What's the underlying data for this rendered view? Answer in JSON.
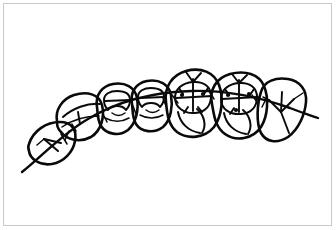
{
  "figure": {
    "title": "Occlusal view line drawing of a posterior dental arch segment",
    "caption": "",
    "view": "occlusal",
    "style": "hand-drawn black ink line art on white background",
    "background_color": "#ffffff",
    "ink_color": "#0a0a0a",
    "frame_color": "#c9c9c9",
    "width": 336,
    "height": 230
  },
  "chart_data": {
    "type": "diagram",
    "title": "Occlusal view line drawing of a posterior dental arch segment",
    "xlabel": "",
    "ylabel": "",
    "grid": false,
    "legend": false,
    "annotations": [],
    "arch_line": {
      "name": "arch-curve",
      "description": "Long continuous curved line (arch wire / occlusal plane reference) passing through all teeth",
      "start": [
        22,
        172
      ],
      "end": [
        318,
        118
      ],
      "apex": [
        200,
        103
      ]
    },
    "teeth": [
      {
        "index": 1,
        "name": "tooth-rotated-anterior",
        "label": "rotated premolar",
        "position": "far-left, tipped and rotated below the arch line",
        "center": [
          57,
          143
        ],
        "has_cusp_dots": false,
        "markings": "two internal converging ridge lines"
      },
      {
        "index": 2,
        "name": "tooth-premolar-1",
        "label": "premolar",
        "position": "left",
        "center": [
          80,
          113
        ],
        "has_cusp_dots": false,
        "markings": "single long mesiodistal ridge line"
      },
      {
        "index": 3,
        "name": "tooth-premolar-2",
        "label": "premolar",
        "position": "left-center",
        "center": [
          113,
          106
        ],
        "has_cusp_dots": false,
        "markings": "squared occlusal table outline with central groove"
      },
      {
        "index": 4,
        "name": "tooth-premolar-3",
        "label": "premolar",
        "position": "center-left",
        "center": [
          147,
          102
        ],
        "has_cusp_dots": false,
        "markings": "squared occlusal table outline with central groove"
      },
      {
        "index": 5,
        "name": "tooth-molar-1",
        "label": "first molar",
        "position": "center",
        "center": [
          188,
          100
        ],
        "has_cusp_dots": true,
        "cusp_dot_count": 2,
        "markings": "cruciate occlusal fissure pattern with cusp pits and distal lobe"
      },
      {
        "index": 6,
        "name": "tooth-molar-2",
        "label": "second molar",
        "position": "center-right",
        "center": [
          233,
          103
        ],
        "has_cusp_dots": true,
        "cusp_dot_count": 3,
        "markings": "cruciate occlusal fissure pattern with cusp pits and distal lobe"
      },
      {
        "index": 7,
        "name": "tooth-molar-3",
        "label": "third molar",
        "position": "far-right",
        "center": [
          279,
          112
        ],
        "has_cusp_dots": false,
        "markings": "Y-shaped occlusal fissure pattern"
      }
    ],
    "counts": {
      "total_teeth": 7,
      "teeth_with_cusp_dots": 2,
      "arch_lines": 1
    }
  }
}
